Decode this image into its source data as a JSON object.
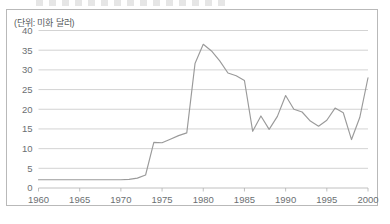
{
  "chart_data": {
    "type": "line",
    "title": "",
    "unit_note": "(단위: 미화 달러)",
    "xlabel": "",
    "ylabel": "",
    "xlim": [
      1960,
      2000
    ],
    "ylim": [
      0,
      40
    ],
    "grid": true,
    "legend": "none",
    "x_ticks": [
      "1960",
      "1965",
      "1970",
      "1975",
      "1980",
      "1985",
      "1990",
      "1995",
      "2000"
    ],
    "x_tick_values": [
      1960,
      1965,
      1970,
      1975,
      1980,
      1985,
      1990,
      1995,
      2000
    ],
    "y_ticks": [
      "0",
      "5",
      "10",
      "15",
      "20",
      "25",
      "30",
      "35",
      "40"
    ],
    "y_tick_values": [
      0,
      5,
      10,
      15,
      20,
      25,
      30,
      35,
      40
    ],
    "line_color": "#9a9a9a",
    "grid_color": "#c8c8c8",
    "x": [
      1960,
      1961,
      1962,
      1963,
      1964,
      1965,
      1966,
      1967,
      1968,
      1969,
      1970,
      1971,
      1972,
      1973,
      1974,
      1975,
      1976,
      1977,
      1978,
      1979,
      1980,
      1981,
      1982,
      1983,
      1984,
      1985,
      1986,
      1987,
      1988,
      1989,
      1990,
      1991,
      1992,
      1993,
      1994,
      1995,
      1996,
      1997,
      1998,
      1999,
      2000
    ],
    "series": [
      {
        "name": "유가",
        "values": [
          2.1,
          2.1,
          2.1,
          2.1,
          2.1,
          2.1,
          2.1,
          2.1,
          2.1,
          2.1,
          2.1,
          2.2,
          2.5,
          3.3,
          11.6,
          11.5,
          12.4,
          13.3,
          14.0,
          31.6,
          36.5,
          34.8,
          32.3,
          29.2,
          28.5,
          27.3,
          14.4,
          18.3,
          14.9,
          18.2,
          23.5,
          20.0,
          19.3,
          17.0,
          15.7,
          17.2,
          20.3,
          19.1,
          12.3,
          17.9,
          28.0
        ]
      }
    ]
  }
}
